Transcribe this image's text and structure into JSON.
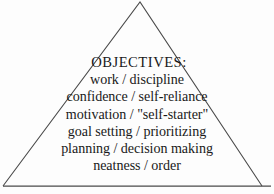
{
  "figure": {
    "shape": "triangle",
    "title": "OBJECTIVES:",
    "lines": [
      "work / discipline",
      "confidence / self-reliance",
      "motivation / \"self-starter\"",
      "goal setting / prioritizing",
      "planning / decision making",
      "neatness / order"
    ],
    "colors": {
      "background": "#fdfdfd",
      "outline": "#4a4a4a",
      "text": "#1a1a1a"
    }
  }
}
